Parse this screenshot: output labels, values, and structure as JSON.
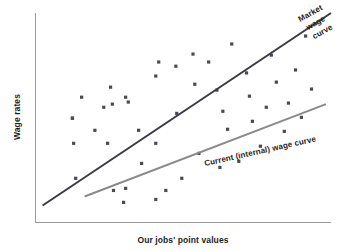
{
  "chart_data": {
    "type": "scatter",
    "title": "",
    "subtitle": "",
    "xlabel": "Our jobs' point values",
    "ylabel": "Wage rates",
    "xlim": [
      0,
      100
    ],
    "ylim": [
      0,
      100
    ],
    "grid": false,
    "legend_position": "inline-annotations",
    "axis_ticks": {
      "x": [],
      "y": []
    },
    "series": [
      {
        "name": "Job data points",
        "type": "scatter",
        "marker": "square",
        "color": "#4a4a52",
        "points": [
          [
            25.4,
            64.6
          ],
          [
            26.0,
            56.5
          ],
          [
            31.4,
            57.5
          ],
          [
            40.7,
            69.9
          ],
          [
            41.7,
            76.6
          ],
          [
            47.5,
            74.6
          ],
          [
            53.3,
            80.4
          ],
          [
            53.9,
            66.0
          ],
          [
            15.6,
            59.8
          ],
          [
            23.1,
            55.0
          ],
          [
            12.5,
            49.8
          ],
          [
            30.5,
            59.8
          ],
          [
            12.5,
            49.8
          ],
          [
            12.9,
            37.8
          ],
          [
            13.6,
            21.1
          ],
          [
            24.4,
            37.8
          ],
          [
            34.9,
            44.0
          ],
          [
            40.7,
            37.8
          ],
          [
            44.1,
            15.3
          ],
          [
            26.4,
            15.3
          ],
          [
            29.8,
            9.6
          ],
          [
            30.5,
            16.3
          ],
          [
            40.7,
            11.0
          ],
          [
            58.6,
            76.6
          ],
          [
            61.4,
            63.2
          ],
          [
            63.4,
            53.1
          ],
          [
            65.0,
            44.5
          ],
          [
            66.4,
            85.2
          ],
          [
            71.4,
            71.4
          ],
          [
            72.4,
            60.3
          ],
          [
            73.4,
            48.3
          ],
          [
            76.1,
            36.4
          ],
          [
            78.1,
            55.0
          ],
          [
            79.8,
            79.9
          ],
          [
            81.5,
            67.0
          ],
          [
            84.2,
            43.5
          ],
          [
            85.6,
            57.0
          ],
          [
            88.0,
            72.8
          ],
          [
            90.0,
            50.2
          ],
          [
            91.4,
            89.0
          ],
          [
            93.4,
            63.7
          ],
          [
            47.8,
            52.1
          ],
          [
            55.3,
            33.0
          ],
          [
            62.4,
            26.3
          ],
          [
            68.8,
            29.2
          ],
          [
            35.9,
            28.2
          ],
          [
            20.1,
            44.0
          ],
          [
            49.5,
            21.1
          ]
        ]
      },
      {
        "name": "Market wage curve",
        "type": "line",
        "color": "#3a3a42",
        "label": "Market wage curve",
        "label_lines": [
          "Market",
          "wage",
          "curve"
        ],
        "start": [
          2.4,
          8.1
        ],
        "end": [
          100.0,
          100.0
        ]
      },
      {
        "name": "Current (internal) wage curve",
        "type": "line",
        "color": "#8a8a8a",
        "label": "Current (internal) wage curve",
        "label_lines": [
          "Current (internal) wage curve"
        ],
        "start": [
          16.6,
          12.4
        ],
        "end": [
          98.3,
          56.5
        ]
      }
    ]
  },
  "annotations": {
    "market_line_1": "Market",
    "market_line_2": "wage",
    "market_line_3": "curve",
    "current_label": "Current (internal) wage curve"
  },
  "axes": {
    "x_title": "Our jobs' point values",
    "y_title": "Wage rates"
  },
  "colors": {
    "market_line": "#3a3a42",
    "current_line": "#8a8a8a",
    "dot": "#4a4a52",
    "axis": "#9a9a9a",
    "text": "#1d1d1d",
    "background": "#ffffff"
  }
}
